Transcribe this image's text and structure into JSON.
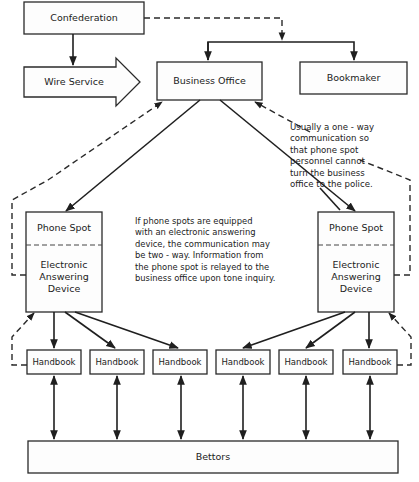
{
  "diagram": {
    "colors": {
      "line": "#1f1f1f",
      "box_fill": "#fdfdfd",
      "background": "#ffffff"
    },
    "nodes": {
      "confederation": "Confederation",
      "wire_service": "Wire Service",
      "business_office": "Business Office",
      "bookmaker": "Bookmaker",
      "phone_spot_left": {
        "top": "Phone Spot",
        "bottom": "Electronic\nAnswering\nDevice"
      },
      "phone_spot_right": {
        "top": "Phone Spot",
        "bottom": "Electronic\nAnswering\nDevice"
      },
      "handbooks": [
        "Handbook",
        "Handbook",
        "Handbook",
        "Handbook",
        "Handbook",
        "Handbook"
      ],
      "bettors": "Bettors"
    },
    "notes": {
      "one_way": "Usually a one - way\ncommunication so\nthat phone spot\npersonnel cannot\nturn the business\noffice to the police.",
      "two_way": "If phone spots are equipped\nwith an electronic answering\ndevice, the communication may\nbe two - way.  Information from\nthe phone spot is relayed to the\nbusiness office upon tone inquiry."
    },
    "edges": [
      {
        "from": "Confederation",
        "to": "Wire Service",
        "style": "solid"
      },
      {
        "from": "Confederation",
        "to": "Business Office / Bookmaker",
        "style": "dashed"
      },
      {
        "from": "Wire Service",
        "to": "Business Office",
        "style": "block-arrow"
      },
      {
        "from": "Business Office",
        "to": "Phone Spot (left)",
        "style": "solid"
      },
      {
        "from": "Business Office",
        "to": "Phone Spot (right)",
        "style": "solid"
      },
      {
        "from": "Phone Spot (left)",
        "to": "Business Office",
        "style": "dashed"
      },
      {
        "from": "Phone Spot (right)",
        "to": "Business Office",
        "style": "dashed"
      },
      {
        "from": "Phone Spot",
        "to": "Handbook",
        "style": "solid"
      },
      {
        "from": "Handbook",
        "to": "Phone Spot",
        "style": "dashed"
      },
      {
        "from": "Handbook",
        "to": "Bettors",
        "style": "solid-bidirectional"
      }
    ]
  }
}
